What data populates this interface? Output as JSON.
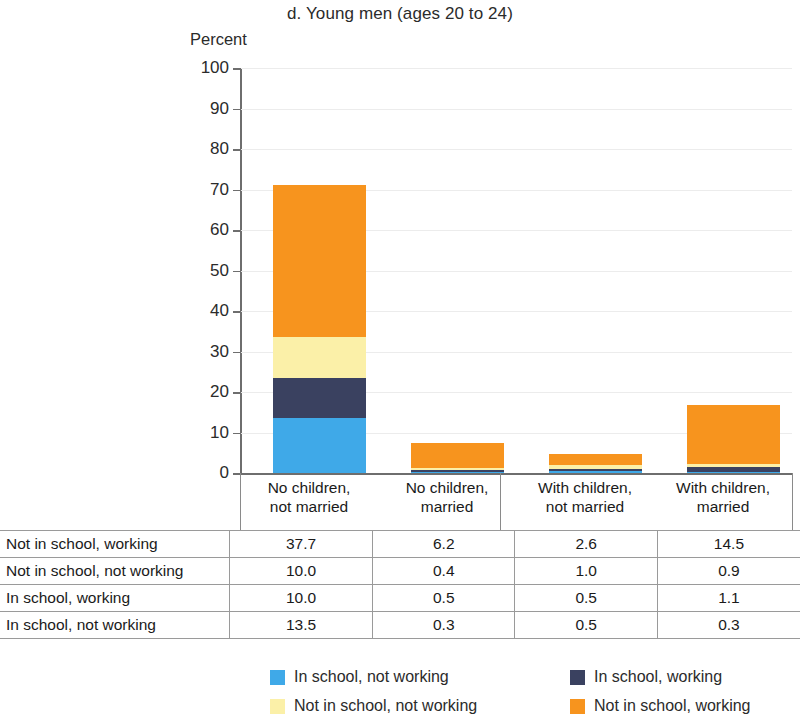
{
  "chart_data": {
    "type": "bar",
    "stacked": true,
    "title": "d. Young men (ages 20 to 24)",
    "ylabel": "Percent",
    "xlabel": "",
    "ylim": [
      0,
      100
    ],
    "yticks": [
      0,
      10,
      20,
      30,
      40,
      50,
      60,
      70,
      80,
      90,
      100
    ],
    "grid": true,
    "legend_position": "bottom",
    "categories": [
      "No children, not married",
      "No children, married",
      "With children, not married",
      "With children, married"
    ],
    "category_lines": [
      [
        "No children,",
        "not married"
      ],
      [
        "No children,",
        "married"
      ],
      [
        "With children,",
        "not married"
      ],
      [
        "With children,",
        "married"
      ]
    ],
    "series": [
      {
        "name": "In school, not working",
        "color": "#3FA9E8",
        "values": [
          13.5,
          0.3,
          0.5,
          0.3
        ]
      },
      {
        "name": "In school, working",
        "color": "#3A4160",
        "values": [
          10.0,
          0.5,
          0.5,
          1.1
        ]
      },
      {
        "name": "Not in school, not working",
        "color": "#FBF0A8",
        "values": [
          10.0,
          0.4,
          1.0,
          0.9
        ]
      },
      {
        "name": "Not in school, working",
        "color": "#F7941E",
        "values": [
          37.7,
          6.2,
          2.6,
          14.5
        ]
      }
    ],
    "totals": [
      71.2,
      7.4,
      4.6,
      16.8
    ]
  },
  "table": {
    "rows": [
      {
        "label": "Not in school, working",
        "values": [
          "37.7",
          "6.2",
          "2.6",
          "14.5"
        ]
      },
      {
        "label": "Not in school, not working",
        "values": [
          "10.0",
          "0.4",
          "1.0",
          "0.9"
        ]
      },
      {
        "label": "In school, working",
        "values": [
          "10.0",
          "0.5",
          "0.5",
          "1.1"
        ]
      },
      {
        "label": "In school, not working",
        "values": [
          "13.5",
          "0.3",
          "0.5",
          "0.3"
        ]
      }
    ]
  },
  "legend": {
    "items": [
      {
        "label": "In school, not working",
        "color": "#3FA9E8"
      },
      {
        "label": "In school, working",
        "color": "#3A4160"
      },
      {
        "label": "Not in school, not working",
        "color": "#FBF0A8"
      },
      {
        "label": "Not in school, working",
        "color": "#F7941E"
      }
    ]
  }
}
